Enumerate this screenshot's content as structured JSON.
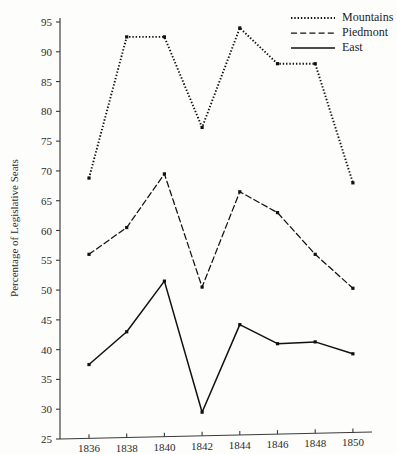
{
  "figure": {
    "background_color": "#fdfdfc",
    "ink_color": "#111111",
    "axis_color": "#3a3a3a"
  },
  "chart_data": {
    "type": "line",
    "title": "",
    "xlabel": "",
    "ylabel": "Percentage of Legislative Seats",
    "x": [
      1836,
      1838,
      1840,
      1842,
      1844,
      1846,
      1848,
      1850
    ],
    "xticklabels": [
      "1836",
      "1838",
      "1840",
      "1842",
      "1844",
      "1846",
      "1848",
      "1850"
    ],
    "yticks": [
      25,
      30,
      35,
      40,
      45,
      50,
      55,
      60,
      65,
      70,
      75,
      80,
      85,
      90,
      95
    ],
    "yticklabels": [
      "25",
      "30",
      "35",
      "40",
      "45",
      "50",
      "55",
      "60",
      "65",
      "70",
      "75",
      "80",
      "85",
      "90",
      "95"
    ],
    "xlim": [
      1835,
      1851
    ],
    "ylim": [
      25,
      95
    ],
    "grid": false,
    "legend_position": "top-right",
    "series": [
      {
        "name": "Mountains",
        "linestyle": "dotted",
        "color": "#111111",
        "marker": "square",
        "values": [
          68.8,
          92.5,
          92.5,
          77.3,
          94.0,
          88.0,
          88.0,
          68.0
        ]
      },
      {
        "name": "Piedmont",
        "linestyle": "dashed",
        "color": "#111111",
        "marker": "square",
        "values": [
          56.0,
          60.5,
          69.5,
          50.5,
          66.5,
          63.0,
          56.0,
          50.3
        ]
      },
      {
        "name": "East",
        "linestyle": "solid",
        "color": "#111111",
        "marker": "square",
        "values": [
          37.5,
          43.0,
          51.5,
          29.5,
          44.2,
          41.0,
          41.3,
          39.3
        ]
      }
    ]
  },
  "legend": {
    "entries": [
      {
        "label": "Mountains",
        "style": "dotted"
      },
      {
        "label": "Piedmont",
        "style": "dashed"
      },
      {
        "label": "East",
        "style": "solid"
      }
    ]
  }
}
